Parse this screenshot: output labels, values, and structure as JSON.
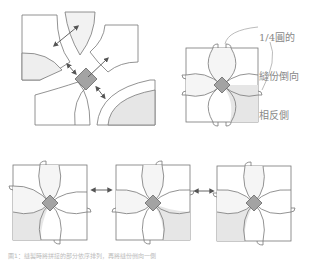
{
  "diagram": {
    "type": "quilt-piecing-instructions",
    "annotation": {
      "lines": [
        "1/4圓的",
        "縫份倒向",
        "相反側"
      ]
    },
    "panels": [
      {
        "id": "exploded-pieces",
        "description": "Four curved block pieces with center diamond, arrows showing assembly"
      },
      {
        "id": "assembled-block",
        "description": "Assembled block showing seam allowances folded to opposite side"
      },
      {
        "id": "block-1",
        "description": "Block variant with bottom-left shaded"
      },
      {
        "id": "block-2",
        "description": "Block variant with bottom-right shaded"
      },
      {
        "id": "block-3",
        "description": "Block variant with bottom-left shaded"
      }
    ],
    "connectors": [
      "double-arrow",
      "double-arrow"
    ],
    "colors": {
      "line": "#777777",
      "light_fill": "#e6e6e6",
      "center_fill": "#a3a3a3",
      "arrow": "#555555"
    },
    "caption": "圖1：縫製時將拼接的部分依序排列，再將縫份倒向一側"
  }
}
